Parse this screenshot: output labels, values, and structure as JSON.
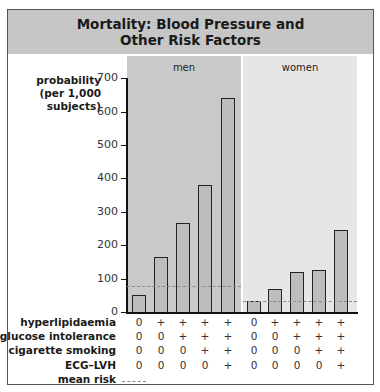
{
  "title": "Mortality: Blood Pressure and Other Risk Factors",
  "title_lines": [
    "Mortality: Blood Pressure and",
    "Other Risk Factors"
  ],
  "y_axis_label_lines": [
    "probability",
    "(per 1,000",
    "subjects)"
  ],
  "panels": [
    {
      "label": "men"
    },
    {
      "label": "women"
    }
  ],
  "risk_factor_rows": [
    {
      "label": "hyperlipidaemia",
      "men": [
        "0",
        "+",
        "+",
        "+",
        "+"
      ],
      "women": [
        "0",
        "+",
        "+",
        "+",
        "+"
      ]
    },
    {
      "label": "glucose intolerance",
      "men": [
        "0",
        "0",
        "+",
        "+",
        "+"
      ],
      "women": [
        "0",
        "0",
        "+",
        "+",
        "+"
      ]
    },
    {
      "label": "cigarette smoking",
      "men": [
        "0",
        "0",
        "0",
        "+",
        "+"
      ],
      "women": [
        "0",
        "0",
        "0",
        "+",
        "+"
      ]
    },
    {
      "label": "ECG–LVH",
      "men": [
        "0",
        "0",
        "0",
        "0",
        "+"
      ],
      "women": [
        "0",
        "0",
        "0",
        "0",
        "+"
      ]
    }
  ],
  "legend": {
    "mean_risk_label": "mean risk"
  },
  "chart_data": {
    "type": "bar",
    "title": "Mortality: Blood Pressure and Other Risk Factors",
    "xlabel": "",
    "ylabel": "probability (per 1,000 subjects)",
    "ylim": [
      0,
      700
    ],
    "yticks": [
      0,
      100,
      200,
      300,
      400,
      500,
      600,
      700
    ],
    "grid": false,
    "categories": [
      "none",
      "hyperlipidaemia",
      "+glucose intolerance",
      "+cigarette smoking",
      "+ECG–LVH"
    ],
    "series": [
      {
        "name": "men",
        "values": [
          50,
          165,
          265,
          380,
          640
        ],
        "mean_risk": 77
      },
      {
        "name": "women",
        "values": [
          33,
          69,
          121,
          127,
          247
        ],
        "mean_risk": 33
      }
    ],
    "legend": [
      "mean risk (dashed line)"
    ],
    "colors": {
      "men_panel": "#c9c9c9",
      "women_panel": "#e6e6e6",
      "bar_fill": "#bdbdbd",
      "bar_outline": "#222222",
      "mean_line": "#8a8a8a",
      "header": "#c6c6c6"
    }
  }
}
